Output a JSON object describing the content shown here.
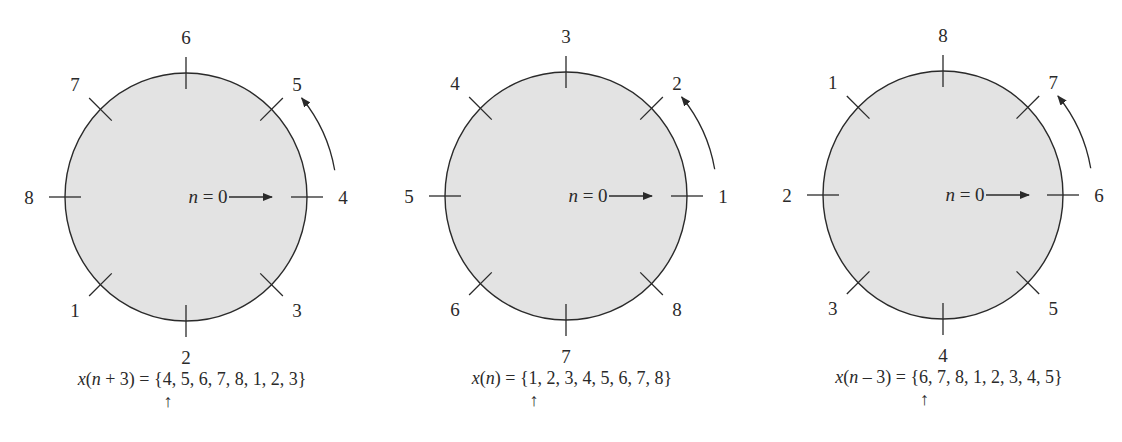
{
  "diagrams": [
    {
      "id": "shift-plus-3",
      "center": [
        186,
        197
      ],
      "radius": [
        121,
        124
      ],
      "labels": [
        "4",
        "5",
        "6",
        "7",
        "8",
        "1",
        "2",
        "3"
      ],
      "n0_label": "n = 0",
      "equation": {
        "lhs_fn": "x",
        "lhs_arg": "n + 3",
        "rhs": "{4, 5, 6, 7, 8, 1, 2, 3}"
      },
      "sequence": [
        4,
        5,
        6,
        7,
        8,
        1,
        2,
        3
      ],
      "pointer_index": 0
    },
    {
      "id": "original",
      "center": [
        566,
        196
      ],
      "radius": [
        121,
        124
      ],
      "labels": [
        "1",
        "2",
        "3",
        "4",
        "5",
        "6",
        "7",
        "8"
      ],
      "n0_label": "n = 0",
      "equation": {
        "lhs_fn": "x",
        "lhs_arg": "n",
        "rhs": "{1, 2, 3, 4, 5, 6, 7, 8}"
      },
      "sequence": [
        1,
        2,
        3,
        4,
        5,
        6,
        7,
        8
      ],
      "pointer_index": 0
    },
    {
      "id": "shift-minus-3",
      "center": [
        943,
        195
      ],
      "radius": [
        120,
        124
      ],
      "labels": [
        "6",
        "7",
        "8",
        "1",
        "2",
        "3",
        "4",
        "5"
      ],
      "n0_label": "n = 0",
      "equation": {
        "lhs_fn": "x",
        "lhs_arg": "n – 3",
        "rhs": "{6, 7, 8, 1, 2, 3, 4, 5}"
      },
      "sequence": [
        6,
        7,
        8,
        1,
        2,
        3,
        4,
        5
      ],
      "pointer_index": 0
    }
  ],
  "pointer_glyph": "↑",
  "colors": {
    "fill": "#e3e3e3",
    "stroke": "#2a2a2a",
    "background": "#ffffff"
  }
}
